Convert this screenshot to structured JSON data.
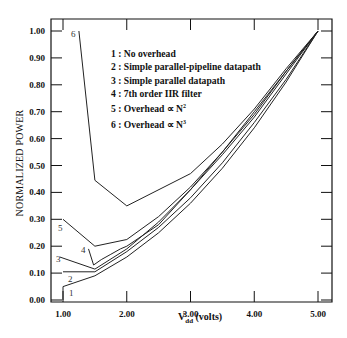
{
  "chart_data": {
    "type": "line",
    "title": "",
    "xlabel": "Vdd (volts)",
    "ylabel": "NORMALIZED POWER",
    "xlim": [
      1.0,
      5.0
    ],
    "ylim": [
      0.0,
      1.0
    ],
    "grid": false,
    "legend_position": "upper-left-inside",
    "x_ticks": [
      "1.00",
      "2.00",
      "3.00",
      "4.00",
      "5.00"
    ],
    "y_ticks": [
      "0.00",
      "0.10",
      "0.20",
      "0.30",
      "0.40",
      "0.50",
      "0.60",
      "0.70",
      "0.80",
      "0.90",
      "1.00"
    ],
    "series": [
      {
        "id": "1",
        "name": "No overhead",
        "x": [
          1.0,
          1.0,
          1.5,
          2.0,
          2.5,
          3.0,
          3.5,
          4.0,
          4.5,
          5.0
        ],
        "y": [
          0.0,
          0.05,
          0.09,
          0.16,
          0.25,
          0.36,
          0.49,
          0.64,
          0.81,
          1.0
        ]
      },
      {
        "id": "2",
        "name": "Simple parallel-pipeline datapath",
        "x": [
          1.0,
          1.5,
          2.0,
          2.5,
          3.0,
          3.5,
          4.0,
          4.5,
          5.0
        ],
        "y": [
          0.105,
          0.105,
          0.18,
          0.27,
          0.38,
          0.51,
          0.66,
          0.82,
          1.0
        ]
      },
      {
        "id": "3",
        "name": "Simple parallel datapath",
        "x": [
          0.95,
          1.5,
          2.0,
          2.5,
          3.0,
          3.5,
          4.0,
          4.5,
          5.0
        ],
        "y": [
          0.16,
          0.115,
          0.19,
          0.29,
          0.41,
          0.54,
          0.68,
          0.84,
          1.0
        ]
      },
      {
        "id": "4",
        "name": "7th order IIR filter",
        "x": [
          1.4,
          1.48,
          1.6,
          1.75,
          1.9,
          2.0,
          2.5,
          3.0,
          3.5,
          4.0,
          4.5,
          5.0
        ],
        "y": [
          0.19,
          0.13,
          0.15,
          0.17,
          0.19,
          0.2,
          0.28,
          0.41,
          0.55,
          0.69,
          0.85,
          1.0
        ]
      },
      {
        "id": "5",
        "name": "Overhead ∝ N²",
        "x": [
          1.0,
          1.5,
          2.0,
          2.5,
          3.0,
          3.5,
          4.0,
          4.5,
          5.0
        ],
        "y": [
          0.3,
          0.2,
          0.225,
          0.31,
          0.42,
          0.55,
          0.7,
          0.85,
          1.0
        ]
      },
      {
        "id": "6",
        "name": "Overhead ∝ N³",
        "x": [
          1.25,
          1.5,
          2.0,
          3.0,
          3.5,
          4.0,
          4.5,
          5.0
        ],
        "y": [
          1.0,
          0.445,
          0.35,
          0.47,
          0.58,
          0.71,
          0.86,
          1.0
        ]
      }
    ]
  },
  "legend": {
    "items": [
      {
        "num": "1",
        "label": "No overhead",
        "sup": ""
      },
      {
        "num": "2",
        "label": "Simple parallel-pipeline datapath",
        "sup": ""
      },
      {
        "num": "3",
        "label": "Simple parallel datapath",
        "sup": ""
      },
      {
        "num": "4",
        "label": "7th order IIR filter",
        "sup": ""
      },
      {
        "num": "5",
        "label": "Overhead ∝ N",
        "sup": "2"
      },
      {
        "num": "6",
        "label": "Overhead ∝ N",
        "sup": "3"
      }
    ]
  },
  "axes": {
    "ylabel": "NORMALIZED POWER",
    "xlabel_main": "V",
    "xlabel_sub": "dd",
    "xlabel_unit": " (volts)"
  },
  "colors": {
    "line": "#222222",
    "axis": "#111111",
    "background": "#ffffff"
  }
}
